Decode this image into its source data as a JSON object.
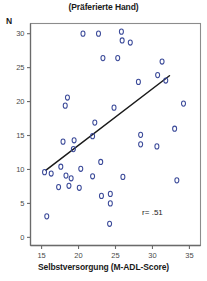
{
  "chart_data": {
    "type": "scatter",
    "title": "(Präferierte Hand)",
    "xlabel": "Selbstversorgung (M-ADL-Score)",
    "ylabel": "N",
    "xlim": [
      13.5,
      36.5
    ],
    "ylim": [
      -1.2,
      31.5
    ],
    "grid": false,
    "legend": null,
    "marker": "open-circle",
    "marker_color": "#3b4a99",
    "annotation": "r= .51",
    "annotation_x": 30.0,
    "annotation_y": 3.3,
    "xticks": [
      15,
      20,
      25,
      30,
      35
    ],
    "yticks": [
      0,
      5,
      10,
      15,
      20,
      25,
      30
    ],
    "xtick_labels": [
      "15",
      "20",
      "25",
      "30",
      "35"
    ],
    "ytick_labels": [
      "0",
      "5",
      "10",
      "15",
      "20",
      "25",
      "30"
    ],
    "points": [
      {
        "x": 20.6,
        "y": 30.0
      },
      {
        "x": 22.7,
        "y": 30.0
      },
      {
        "x": 25.8,
        "y": 30.3
      },
      {
        "x": 25.9,
        "y": 29.0
      },
      {
        "x": 27.0,
        "y": 28.7
      },
      {
        "x": 23.3,
        "y": 26.4
      },
      {
        "x": 25.3,
        "y": 26.4
      },
      {
        "x": 31.3,
        "y": 25.9
      },
      {
        "x": 30.7,
        "y": 23.9
      },
      {
        "x": 31.8,
        "y": 23.1
      },
      {
        "x": 28.1,
        "y": 22.9
      },
      {
        "x": 18.5,
        "y": 20.6
      },
      {
        "x": 18.2,
        "y": 19.4
      },
      {
        "x": 34.2,
        "y": 19.7
      },
      {
        "x": 24.8,
        "y": 19.1
      },
      {
        "x": 22.2,
        "y": 16.9
      },
      {
        "x": 33.0,
        "y": 16.0
      },
      {
        "x": 21.9,
        "y": 14.9
      },
      {
        "x": 17.9,
        "y": 14.1
      },
      {
        "x": 19.4,
        "y": 14.3
      },
      {
        "x": 28.4,
        "y": 15.1
      },
      {
        "x": 28.4,
        "y": 13.7
      },
      {
        "x": 30.6,
        "y": 13.4
      },
      {
        "x": 19.3,
        "y": 13.0
      },
      {
        "x": 23.0,
        "y": 11.1
      },
      {
        "x": 17.6,
        "y": 10.4
      },
      {
        "x": 20.3,
        "y": 10.1
      },
      {
        "x": 15.4,
        "y": 9.6
      },
      {
        "x": 16.3,
        "y": 9.4
      },
      {
        "x": 18.3,
        "y": 9.1
      },
      {
        "x": 19.0,
        "y": 8.7
      },
      {
        "x": 21.9,
        "y": 9.0
      },
      {
        "x": 26.0,
        "y": 8.9
      },
      {
        "x": 33.3,
        "y": 8.4
      },
      {
        "x": 17.3,
        "y": 7.4
      },
      {
        "x": 18.7,
        "y": 7.6
      },
      {
        "x": 20.1,
        "y": 7.3
      },
      {
        "x": 23.1,
        "y": 6.1
      },
      {
        "x": 24.3,
        "y": 6.4
      },
      {
        "x": 24.3,
        "y": 5.0
      },
      {
        "x": 15.7,
        "y": 3.1
      },
      {
        "x": 24.2,
        "y": 2.0
      }
    ],
    "regression_line": {
      "x_start": 15.6,
      "y_start": 9.9,
      "x_end": 32.3,
      "y_end": 23.8,
      "color": "#1a1a1a"
    }
  }
}
